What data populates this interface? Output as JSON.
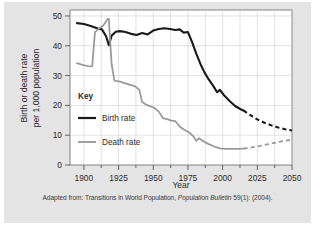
{
  "figure": {
    "caption_prefix": "Adapted from: Transitions in World Population, ",
    "caption_italic": "Population Bulletin",
    "caption_suffix": " 59(1): (2004).",
    "panel_bg": "#e4e4e4"
  },
  "chart_data": {
    "type": "line",
    "title": "",
    "xlabel": "Year",
    "ylabel": "Birth or death rate\nper 1,000 population",
    "ylabel_line1": "Birth or death rate",
    "ylabel_line2": "per 1,000 population",
    "xlim": [
      1890,
      2050
    ],
    "ylim": [
      0,
      52
    ],
    "xticks": [
      1900,
      1925,
      1950,
      1975,
      2000,
      2025,
      2050
    ],
    "xtick_labels": [
      "1900",
      "1925",
      "1950",
      "1975",
      "2000",
      "2025",
      "2050"
    ],
    "xminor_step": 12.5,
    "yticks": [
      0,
      10,
      20,
      30,
      40,
      50
    ],
    "ytick_labels": [
      "0",
      "10",
      "20",
      "30",
      "40",
      "50"
    ],
    "grid": true,
    "legend_position": "inside-left",
    "legend_title": "Key",
    "projection_start_year": 2015,
    "series": [
      {
        "name": "Birth rate",
        "label": "Birth rate",
        "color": "#1a1a1a",
        "width": 2.1,
        "historical": [
          [
            1895,
            47.6
          ],
          [
            1900,
            47.3
          ],
          [
            1905,
            46.6
          ],
          [
            1910,
            45.8
          ],
          [
            1913,
            45.5
          ],
          [
            1916,
            43.2
          ],
          [
            1918,
            40.2
          ],
          [
            1920,
            43.4
          ],
          [
            1923,
            44.7
          ],
          [
            1926,
            44.9
          ],
          [
            1930,
            44.6
          ],
          [
            1934,
            44.0
          ],
          [
            1938,
            43.6
          ],
          [
            1942,
            44.3
          ],
          [
            1946,
            43.8
          ],
          [
            1950,
            45.1
          ],
          [
            1954,
            45.6
          ],
          [
            1958,
            45.9
          ],
          [
            1962,
            45.6
          ],
          [
            1966,
            45.3
          ],
          [
            1969,
            45.5
          ],
          [
            1972,
            44.4
          ],
          [
            1975,
            44.6
          ],
          [
            1978,
            41.2
          ],
          [
            1981,
            37.4
          ],
          [
            1984,
            33.9
          ],
          [
            1987,
            31.0
          ],
          [
            1990,
            28.7
          ],
          [
            1993,
            26.7
          ],
          [
            1996,
            24.4
          ],
          [
            1998,
            25.2
          ],
          [
            2001,
            23.4
          ],
          [
            2005,
            21.5
          ],
          [
            2009,
            19.8
          ],
          [
            2013,
            18.7
          ],
          [
            2015,
            18.3
          ]
        ],
        "projection": [
          [
            2015,
            18.3
          ],
          [
            2020,
            16.7
          ],
          [
            2025,
            15.3
          ],
          [
            2030,
            14.2
          ],
          [
            2035,
            13.3
          ],
          [
            2040,
            12.6
          ],
          [
            2045,
            12.0
          ],
          [
            2050,
            11.6
          ]
        ]
      },
      {
        "name": "Death rate",
        "label": "Death rate",
        "color": "#9a9a9a",
        "width": 1.8,
        "historical": [
          [
            1895,
            34.2
          ],
          [
            1899,
            33.6
          ],
          [
            1903,
            33.2
          ],
          [
            1906,
            33.1
          ],
          [
            1908,
            44.6
          ],
          [
            1911,
            45.8
          ],
          [
            1914,
            46.8
          ],
          [
            1917,
            48.9
          ],
          [
            1918,
            49.0
          ],
          [
            1919,
            41.0
          ],
          [
            1920,
            33.8
          ],
          [
            1922,
            28.3
          ],
          [
            1926,
            28.0
          ],
          [
            1930,
            27.4
          ],
          [
            1934,
            26.8
          ],
          [
            1937,
            26.4
          ],
          [
            1940,
            25.2
          ],
          [
            1942,
            21.1
          ],
          [
            1945,
            20.2
          ],
          [
            1948,
            19.7
          ],
          [
            1951,
            19.1
          ],
          [
            1954,
            17.9
          ],
          [
            1957,
            15.7
          ],
          [
            1960,
            15.4
          ],
          [
            1963,
            14.9
          ],
          [
            1966,
            14.7
          ],
          [
            1969,
            12.9
          ],
          [
            1972,
            11.9
          ],
          [
            1976,
            10.9
          ],
          [
            1979,
            9.6
          ],
          [
            1981,
            8.1
          ],
          [
            1983,
            9.0
          ],
          [
            1986,
            8.0
          ],
          [
            1990,
            7.0
          ],
          [
            1994,
            6.2
          ],
          [
            1998,
            5.6
          ],
          [
            2002,
            5.4
          ],
          [
            2007,
            5.4
          ],
          [
            2011,
            5.4
          ],
          [
            2015,
            5.5
          ]
        ],
        "projection": [
          [
            2015,
            5.5
          ],
          [
            2021,
            5.9
          ],
          [
            2027,
            6.4
          ],
          [
            2033,
            7.0
          ],
          [
            2039,
            7.6
          ],
          [
            2045,
            8.1
          ],
          [
            2050,
            8.5
          ]
        ]
      }
    ]
  }
}
